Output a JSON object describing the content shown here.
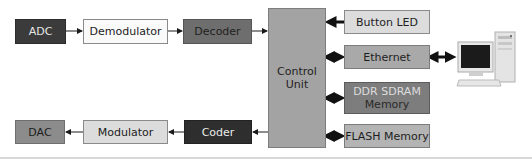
{
  "diagram": {
    "type": "block-diagram",
    "receive_chain": [
      {
        "id": "adc",
        "label": "ADC"
      },
      {
        "id": "demodulator",
        "label": "Demodulator"
      },
      {
        "id": "decoder",
        "label": "Decoder"
      }
    ],
    "transmit_chain": [
      {
        "id": "coder",
        "label": "Coder"
      },
      {
        "id": "modulator",
        "label": "Modulator"
      },
      {
        "id": "dac",
        "label": "DAC"
      }
    ],
    "control_unit": {
      "label_line1": "Control",
      "label_line2": "Unit"
    },
    "peripherals": [
      {
        "id": "button_led",
        "label": "Button LED",
        "arrow": "to-control"
      },
      {
        "id": "ethernet",
        "label": "Ethernet",
        "arrow": "bidirectional"
      },
      {
        "id": "ddr_sdram",
        "label_line1": "DDR SDRAM",
        "label_line2": "Memory",
        "arrow": "bidirectional"
      },
      {
        "id": "flash",
        "label": "FLASH Memory",
        "arrow": "bidirectional"
      }
    ],
    "external": {
      "id": "computer",
      "icon": "desktop-computer-icon",
      "arrow": "bidirectional-with-ethernet"
    },
    "connections": [
      {
        "from": "ADC",
        "to": "Demodulator"
      },
      {
        "from": "Demodulator",
        "to": "Decoder"
      },
      {
        "from": "Decoder",
        "to": "Control Unit"
      },
      {
        "from": "Control Unit",
        "to": "Coder"
      },
      {
        "from": "Coder",
        "to": "Modulator"
      },
      {
        "from": "Modulator",
        "to": "DAC"
      },
      {
        "from": "Button LED",
        "to": "Control Unit"
      },
      {
        "from": "Ethernet",
        "to": "Control Unit",
        "bidirectional": true
      },
      {
        "from": "DDR SDRAM Memory",
        "to": "Control Unit",
        "bidirectional": true
      },
      {
        "from": "FLASH Memory",
        "to": "Control Unit",
        "bidirectional": true
      },
      {
        "from": "Computer",
        "to": "Ethernet",
        "bidirectional": true
      }
    ]
  }
}
